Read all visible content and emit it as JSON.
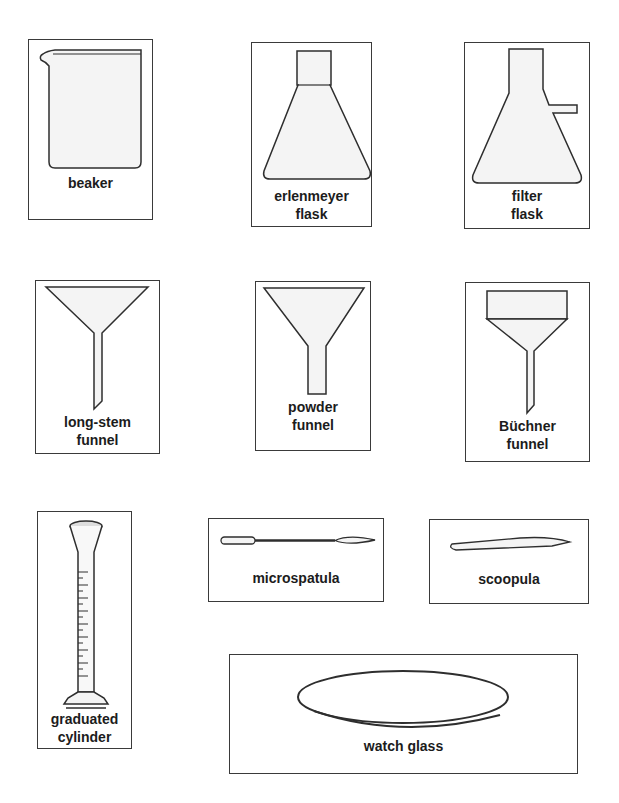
{
  "items": [
    {
      "id": "beaker",
      "label_lines": [
        "beaker"
      ]
    },
    {
      "id": "erlenmeyer-flask",
      "label_lines": [
        "erlenmeyer",
        "flask"
      ]
    },
    {
      "id": "filter-flask",
      "label_lines": [
        "filter",
        "flask"
      ]
    },
    {
      "id": "long-stem-funnel",
      "label_lines": [
        "long-stem",
        "funnel"
      ]
    },
    {
      "id": "powder-funnel",
      "label_lines": [
        "powder",
        "funnel"
      ]
    },
    {
      "id": "buchner-funnel",
      "label_lines": [
        "Büchner",
        "funnel"
      ]
    },
    {
      "id": "graduated-cylinder",
      "label_lines": [
        "graduated",
        "cylinder"
      ],
      "brand": "PYREX",
      "scale": [
        "9",
        "8",
        "7",
        "6",
        "5",
        "4",
        "3",
        "2",
        "1"
      ]
    },
    {
      "id": "microspatula",
      "label_lines": [
        "microspatula"
      ]
    },
    {
      "id": "scoopula",
      "label_lines": [
        "scoopula"
      ]
    },
    {
      "id": "watch-glass",
      "label_lines": [
        "watch glass"
      ]
    }
  ],
  "colors": {
    "stroke": "#2e2e2e",
    "fill": "#f4f4f4",
    "text": "#1c1c1c"
  }
}
